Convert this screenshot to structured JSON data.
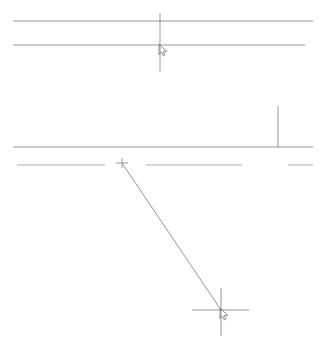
{
  "canvas": {
    "width": 320,
    "height": 346,
    "background_color": "#ffffff",
    "line_color": "#8a8a8a",
    "line_color_light": "#a5a5a5",
    "cursor_color": "#7a7a7a",
    "line_width": 0.9
  },
  "geometry": {
    "horizontal_lines": [
      {
        "name": "top-wall-line-outer",
        "x1": 13,
        "y1": 21,
        "x2": 313,
        "y2": 21
      },
      {
        "name": "top-wall-line-inner",
        "x1": 13,
        "y1": 45,
        "x2": 305,
        "y2": 45
      },
      {
        "name": "middle-wall-line",
        "x1": 13,
        "y1": 147,
        "x2": 313,
        "y2": 147
      }
    ],
    "dashed_row": {
      "name": "lower-wall-dashed-row",
      "y": 165,
      "segments": [
        {
          "name": "dash-left",
          "x1": 17,
          "x2": 105
        },
        {
          "name": "dash-middle",
          "x1": 146,
          "x2": 242
        },
        {
          "name": "dash-right",
          "x1": 288,
          "x2": 313
        }
      ]
    },
    "vertical_lines": [
      {
        "name": "top-crosshair-vertical",
        "x1": 160,
        "y1": 13,
        "x2": 160,
        "y2": 72
      },
      {
        "name": "right-partition-vertical",
        "x1": 278,
        "y1": 106,
        "x2": 278,
        "y2": 147
      }
    ],
    "diagonal_line": {
      "name": "measurement-diagonal",
      "x1": 122,
      "y1": 163,
      "x2": 221,
      "y2": 310
    },
    "snap_markers": [
      {
        "name": "snap-marker-start",
        "type": "cross",
        "x": 122,
        "y": 163,
        "size": 5
      }
    ],
    "crosshairs": [
      {
        "name": "top-crosshair",
        "x": 160,
        "y": 46,
        "h_x1": 160,
        "h_x2": 160,
        "v_y1": 13,
        "v_y2": 72,
        "has_cursor": true
      },
      {
        "name": "bottom-crosshair",
        "x": 221,
        "y": 310,
        "h_x1": 192,
        "h_x2": 249,
        "v_y1": 288,
        "v_y2": 336,
        "has_cursor": true
      }
    ],
    "cursors": [
      {
        "name": "cursor-top",
        "x": 159,
        "y": 44
      },
      {
        "name": "cursor-bottom",
        "x": 220,
        "y": 308
      }
    ]
  },
  "labels": {
    "application": "CAD Drawing Canvas",
    "tool": "Line",
    "status": ""
  }
}
